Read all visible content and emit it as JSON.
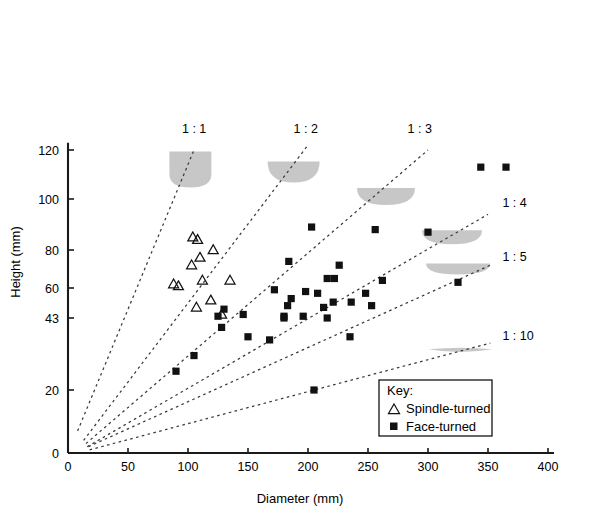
{
  "chart_data": {
    "type": "scatter",
    "title": "",
    "xlabel": "Diameter (mm)",
    "ylabel": "Height (mm)",
    "xlim": [
      0,
      400
    ],
    "ylim": [
      0,
      125
    ],
    "grid": false,
    "xticks": [
      0,
      50,
      100,
      150,
      200,
      250,
      300,
      350,
      400
    ],
    "xtick_labels": [
      "0",
      "50",
      "100",
      "150",
      "200",
      "250",
      "300",
      "350",
      "400"
    ],
    "yticks": [
      0,
      20,
      43,
      60,
      80,
      100,
      120
    ],
    "ytick_labels": [
      "0",
      "20",
      "43",
      "60",
      "80",
      "100",
      "120"
    ],
    "legend": {
      "position": "lower-right",
      "title": "Key:",
      "entries": [
        {
          "marker": "open-triangle",
          "label": "Spindle-turned"
        },
        {
          "marker": "filled-square",
          "label": "Face-turned"
        }
      ]
    },
    "annotations": [
      {
        "text": "1 : 1",
        "ratio": 1,
        "x": 95,
        "y": 127
      },
      {
        "text": "1 : 2",
        "ratio": 2,
        "x": 188,
        "y": 127
      },
      {
        "text": "1 : 3",
        "ratio": 3,
        "x": 283,
        "y": 127
      },
      {
        "text": "1 : 4",
        "ratio": 4,
        "x": 362,
        "y": 97
      },
      {
        "text": "1 : 5",
        "ratio": 5,
        "x": 362,
        "y": 74
      },
      {
        "text": "1 : 10",
        "ratio": 10,
        "x": 362,
        "y": 36
      }
    ],
    "ratio_lines": [
      {
        "label": "1 : 1",
        "ratio": 1,
        "origin": [
          8,
          7
        ],
        "end": [
          105,
          120
        ]
      },
      {
        "label": "1 : 2",
        "ratio": 2,
        "origin": [
          13,
          4
        ],
        "end": [
          200,
          122
        ]
      },
      {
        "label": "1 : 3",
        "ratio": 3,
        "origin": [
          15,
          3
        ],
        "end": [
          300,
          120
        ]
      },
      {
        "label": "1 : 4",
        "ratio": 4,
        "origin": [
          16,
          2
        ],
        "end": [
          350,
          94
        ]
      },
      {
        "label": "1 : 5",
        "ratio": 5,
        "origin": [
          17,
          2
        ],
        "end": [
          352,
          72
        ]
      },
      {
        "label": "1 : 10",
        "ratio": 10,
        "origin": [
          18,
          1
        ],
        "end": [
          352,
          35
        ]
      }
    ],
    "bowl_glyphs": [
      {
        "ratio": 1,
        "cx": 102,
        "cy": 112,
        "w": 42,
        "h": 36,
        "shape": "deep-rounded"
      },
      {
        "ratio": 2,
        "cx": 188,
        "cy": 111,
        "w": 52,
        "h": 21,
        "shape": "hemisphere"
      },
      {
        "ratio": 3,
        "cx": 265,
        "cy": 101,
        "w": 58,
        "h": 17,
        "shape": "hemisphere"
      },
      {
        "ratio": 4,
        "cx": 320,
        "cy": 85,
        "w": 60,
        "h": 14,
        "shape": "hemisphere"
      },
      {
        "ratio": 5,
        "cx": 325,
        "cy": 70,
        "w": 64,
        "h": 11,
        "shape": "hemisphere"
      },
      {
        "ratio": 10,
        "cx": 327,
        "cy": 33,
        "w": 64,
        "h": 5,
        "shape": "flat-ellipse"
      }
    ],
    "series": [
      {
        "name": "Spindle-turned",
        "marker": "open-triangle",
        "points": [
          [
            104,
            85
          ],
          [
            108,
            84
          ],
          [
            121,
            80
          ],
          [
            110,
            76
          ],
          [
            103,
            72
          ],
          [
            88,
            62
          ],
          [
            92,
            61
          ],
          [
            112,
            64
          ],
          [
            135,
            64
          ],
          [
            119,
            53
          ],
          [
            107,
            49
          ],
          [
            128,
            45
          ]
        ]
      },
      {
        "name": "Face-turned",
        "marker": "filled-square",
        "points": [
          [
            344,
            113
          ],
          [
            365,
            113
          ],
          [
            203,
            89
          ],
          [
            256,
            88
          ],
          [
            300,
            87
          ],
          [
            184,
            74
          ],
          [
            226,
            72
          ],
          [
            216,
            65
          ],
          [
            222,
            65
          ],
          [
            262,
            64
          ],
          [
            325,
            63
          ],
          [
            172,
            59
          ],
          [
            198,
            58
          ],
          [
            208,
            57
          ],
          [
            248,
            57
          ],
          [
            186,
            54
          ],
          [
            221,
            52
          ],
          [
            236,
            52
          ],
          [
            183,
            50
          ],
          [
            213,
            49
          ],
          [
            253,
            50
          ],
          [
            125,
            44
          ],
          [
            146,
            45
          ],
          [
            180,
            44
          ],
          [
            196,
            44
          ],
          [
            130,
            48
          ],
          [
            128,
            40
          ],
          [
            180,
            43
          ],
          [
            216,
            43
          ],
          [
            105,
            31
          ],
          [
            90,
            26
          ],
          [
            150,
            37
          ],
          [
            168,
            36
          ],
          [
            235,
            37
          ],
          [
            205,
            20
          ]
        ]
      }
    ]
  }
}
